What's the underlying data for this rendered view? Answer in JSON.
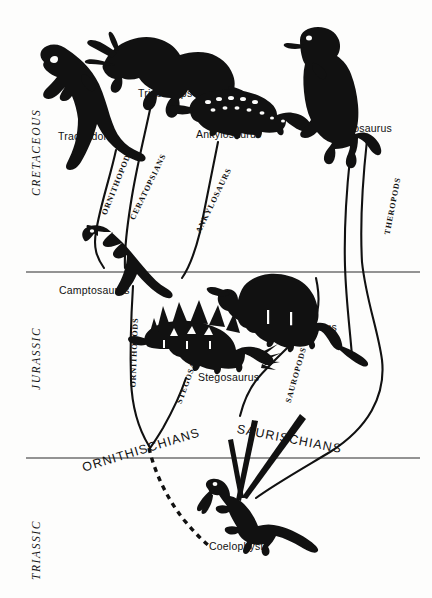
{
  "figure": {
    "type": "dinosaur-evolution-cladogram",
    "background_color": "#fdfdfc",
    "ink_color": "#111111"
  },
  "periods": [
    {
      "name": "CRETACEOUS",
      "x": 30,
      "y": 196
    },
    {
      "name": "JURASSIC",
      "x": 30,
      "y": 390
    },
    {
      "name": "TRIASSIC",
      "x": 30,
      "y": 580
    }
  ],
  "dividers": [
    {
      "name": "cretaceous-jurassic-divider",
      "y": 272
    },
    {
      "name": "jurassic-triassic-divider",
      "y": 458
    }
  ],
  "taxa": [
    {
      "name": "Trachodon",
      "label_x": 58,
      "label_y": 136,
      "period": "CRETACEOUS"
    },
    {
      "name": "Triceratops",
      "label_x": 138,
      "label_y": 93,
      "period": "CRETACEOUS"
    },
    {
      "name": "Ankylosaurus",
      "label_x": 196,
      "label_y": 134,
      "period": "CRETACEOUS"
    },
    {
      "name": "Tyrannosaurus",
      "label_x": 320,
      "label_y": 128,
      "period": "CRETACEOUS"
    },
    {
      "name": "Camptosaurus",
      "label_x": 59,
      "label_y": 290,
      "period": "JURASSIC"
    },
    {
      "name": "Stegosaurus",
      "label_x": 198,
      "label_y": 377,
      "period": "JURASSIC"
    },
    {
      "name": "Brontosaurus",
      "label_x": 272,
      "label_y": 327,
      "period": "JURASSIC"
    },
    {
      "name": "Coelophysis",
      "label_x": 209,
      "label_y": 546,
      "period": "TRIASSIC"
    }
  ],
  "branches": [
    {
      "name": "ORNITHOPODS",
      "x": 104,
      "y": 210,
      "rotate": -68
    },
    {
      "name": "CERATOPSIANS",
      "x": 132,
      "y": 215,
      "rotate": -64
    },
    {
      "name": "ANKYLOSAURS",
      "x": 198,
      "y": 228,
      "rotate": -64
    },
    {
      "name": "THEROPODS",
      "x": 387,
      "y": 230,
      "rotate": -79
    },
    {
      "name": "ORNITHOPODS",
      "x": 133,
      "y": 383,
      "rotate": -88
    },
    {
      "name": "STEGOSAURS",
      "x": 179,
      "y": 399,
      "rotate": -70
    },
    {
      "name": "SAUROPODS",
      "x": 288,
      "y": 398,
      "rotate": -74
    }
  ],
  "clades": [
    {
      "name": "ORNITHISCHIANS",
      "x": 80,
      "y": 452,
      "arc": 16
    },
    {
      "name": "SAURISCHIANS",
      "x": 236,
      "y": 441,
      "arc": -14
    }
  ]
}
